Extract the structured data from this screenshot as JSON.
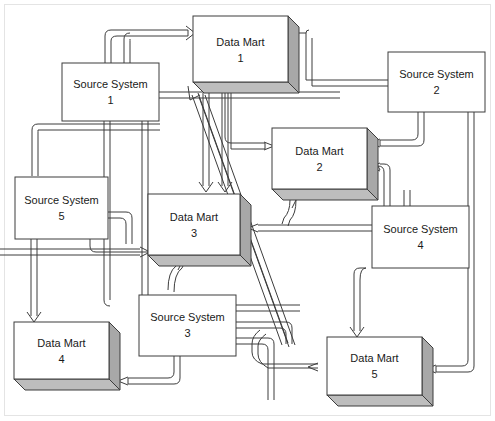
{
  "diagram": {
    "type": "node-link",
    "canvas": {
      "width": 495,
      "height": 421
    },
    "style": {
      "line_color": "#3c3c3c",
      "box_fill": "#ffffff",
      "box_shadow_fill": "#a8a8a8",
      "frame_color": "#e4e4e4",
      "label_color": "#1a1a1a"
    },
    "nodes": [
      {
        "id": "dm1",
        "kind": "data-mart",
        "shape": "3d-box",
        "line1": "Data Mart",
        "line2": "1",
        "x": 193,
        "y": 16,
        "w": 95,
        "h": 66,
        "depth": 11
      },
      {
        "id": "ss1",
        "kind": "source-system",
        "shape": "flat-box",
        "line1": "Source System",
        "line2": "1",
        "x": 62,
        "y": 63,
        "w": 97,
        "h": 58
      },
      {
        "id": "ss2",
        "kind": "source-system",
        "shape": "flat-box",
        "line1": "Source System",
        "line2": "2",
        "x": 388,
        "y": 52,
        "w": 97,
        "h": 60
      },
      {
        "id": "dm2",
        "kind": "data-mart",
        "shape": "3d-box",
        "line1": "Data Mart",
        "line2": "2",
        "x": 272,
        "y": 128,
        "w": 95,
        "h": 61,
        "depth": 11
      },
      {
        "id": "ss5",
        "kind": "source-system",
        "shape": "flat-box",
        "line1": "Source System",
        "line2": "5",
        "x": 15,
        "y": 177,
        "w": 93,
        "h": 62
      },
      {
        "id": "dm3",
        "kind": "data-mart",
        "shape": "3d-box",
        "line1": "Data Mart",
        "line2": "3",
        "x": 148,
        "y": 194,
        "w": 92,
        "h": 61,
        "depth": 11
      },
      {
        "id": "ss4",
        "kind": "source-system",
        "shape": "flat-box",
        "line1": "Source System",
        "line2": "4",
        "x": 372,
        "y": 206,
        "w": 97,
        "h": 62
      },
      {
        "id": "ss3",
        "kind": "source-system",
        "shape": "flat-box",
        "line1": "Source System",
        "line2": "3",
        "x": 139,
        "y": 295,
        "w": 97,
        "h": 61
      },
      {
        "id": "dm4",
        "kind": "data-mart",
        "shape": "3d-box",
        "line1": "Data Mart",
        "line2": "4",
        "x": 14,
        "y": 322,
        "w": 95,
        "h": 57,
        "depth": 11
      },
      {
        "id": "dm5",
        "kind": "data-mart",
        "shape": "3d-box",
        "line1": "Data Mart",
        "line2": "5",
        "x": 327,
        "y": 337,
        "w": 95,
        "h": 58,
        "depth": 11
      }
    ],
    "edges": [
      {
        "from": "ss1",
        "to": "dm1",
        "label": "source-system-1-to-data-mart-1"
      },
      {
        "from": "ss2",
        "to": "dm1",
        "label": "source-system-2-to-data-mart-1"
      },
      {
        "from": "ss3",
        "to": "dm1",
        "label": "source-system-3-to-data-mart-1"
      },
      {
        "from": "dm1",
        "to": "dm2",
        "label": "data-mart-1-to-data-mart-2"
      },
      {
        "from": "dm1",
        "to": "dm3",
        "label": "data-mart-1-to-data-mart-3"
      },
      {
        "from": "ss2",
        "to": "dm2",
        "label": "source-system-2-to-data-mart-2"
      },
      {
        "from": "ss4",
        "to": "dm2",
        "label": "source-system-4-to-data-mart-2"
      },
      {
        "from": "ss3",
        "to": "dm2",
        "label": "source-system-3-to-data-mart-2"
      },
      {
        "from": "ss5",
        "to": "dm3",
        "label": "source-system-5-to-data-mart-3"
      },
      {
        "from": "ss1",
        "to": "dm3",
        "label": "source-system-1-to-data-mart-3"
      },
      {
        "from": "ss3",
        "to": "dm3",
        "label": "source-system-3-to-data-mart-3"
      },
      {
        "from": "ss4",
        "to": "dm3",
        "label": "source-system-4-to-data-mart-3"
      },
      {
        "from": "ss5",
        "to": "dm4",
        "label": "source-system-5-to-data-mart-4"
      },
      {
        "from": "ss1",
        "to": "dm4",
        "label": "source-system-1-to-data-mart-4"
      },
      {
        "from": "ss3",
        "to": "dm4",
        "label": "source-system-3-to-data-mart-4"
      },
      {
        "from": "ss4",
        "to": "dm5",
        "label": "source-system-4-to-data-mart-5"
      },
      {
        "from": "ss2",
        "to": "dm5",
        "label": "source-system-2-to-data-mart-5"
      },
      {
        "from": "ss3",
        "to": "dm5",
        "label": "source-system-3-to-data-mart-5"
      },
      {
        "from": "dm1",
        "to": "dm5",
        "label": "data-mart-1-to-data-mart-5"
      }
    ]
  }
}
